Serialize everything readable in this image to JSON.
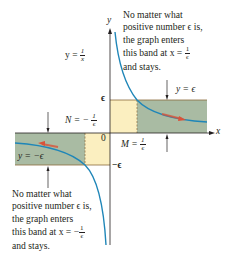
{
  "figure": {
    "axes": {
      "x_label": "x",
      "y_label": "y",
      "origin_label": "0"
    },
    "ticks": {
      "epsilon": "ϵ",
      "neg_epsilon": "−ϵ"
    },
    "function_label": {
      "lhs": "y =",
      "num": "1",
      "den": "x"
    },
    "upper_band": {
      "label": "y = ϵ",
      "M_lhs": "M =",
      "M_num": "1",
      "M_den": "ϵ"
    },
    "lower_band": {
      "label": "y = −ϵ",
      "N_lhs": "N = −",
      "N_num": "1",
      "N_den": "ϵ"
    },
    "annotation_top": {
      "lines": [
        "No matter what",
        "positive number ϵ is,",
        "the graph enters",
        "this band at x =",
        "and stays."
      ],
      "frac_num": "1",
      "frac_den": "ϵ"
    },
    "annotation_bottom": {
      "lines": [
        "No matter what",
        "positive number ϵ is,",
        "the graph enters",
        "this band at x = −",
        "and stays."
      ],
      "frac_num": "1",
      "frac_den": "ϵ"
    },
    "colors": {
      "curve": "#1f86b8",
      "band_green": "#a9bba3",
      "band_yellow": "#fbefc0",
      "arrow_red": "#d9533a",
      "axis": "#231f20"
    }
  }
}
